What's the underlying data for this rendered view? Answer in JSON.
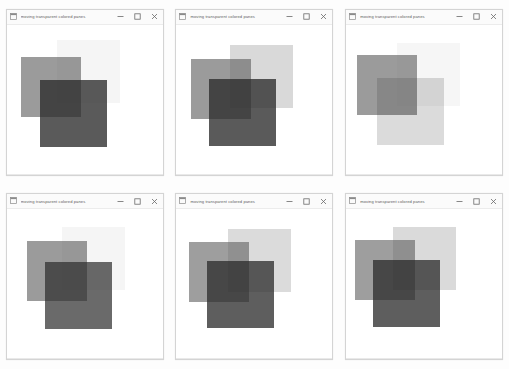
{
  "window": {
    "title": "moving transparent colored panes",
    "app_icon": "app-window-icon",
    "controls": {
      "minimize_label": "—",
      "maximize_label": "□",
      "close_label": "✕"
    }
  },
  "palette": {
    "background": "#ffffff",
    "frame_border": "#d4d4d4",
    "titlebar_bg": "#fbfbfb",
    "title_text": "#5c5c5c",
    "pane_dark": "#3f3f3f",
    "pane_mid": "#6f6f6f",
    "pane_light": "#d9d9d9",
    "pane_faint": "#f2f2f2",
    "overlap_black": "#0a0a0a"
  },
  "frames": [
    {
      "id": "frame-1",
      "title": "moving transparent colored panes",
      "panes": [
        {
          "name": "pane-light",
          "x": 50,
          "y": 15,
          "w": 63,
          "h": 63,
          "color": "#9b9b9b",
          "opacity": 0.1
        },
        {
          "name": "pane-mid",
          "x": 14,
          "y": 32,
          "w": 60,
          "h": 60,
          "color": "#5e5e5e",
          "opacity": 0.62
        },
        {
          "name": "pane-dark",
          "x": 33,
          "y": 55,
          "w": 67,
          "h": 67,
          "color": "#2b2b2b",
          "opacity": 0.78
        }
      ]
    },
    {
      "id": "frame-2",
      "title": "moving transparent colored panes",
      "panes": [
        {
          "name": "pane-light",
          "x": 54,
          "y": 20,
          "w": 63,
          "h": 63,
          "color": "#8f8f8f",
          "opacity": 0.34
        },
        {
          "name": "pane-mid",
          "x": 15,
          "y": 34,
          "w": 60,
          "h": 60,
          "color": "#5e5e5e",
          "opacity": 0.62
        },
        {
          "name": "pane-dark",
          "x": 33,
          "y": 54,
          "w": 67,
          "h": 67,
          "color": "#2b2b2b",
          "opacity": 0.78
        }
      ]
    },
    {
      "id": "frame-3",
      "title": "moving transparent colored panes",
      "panes": [
        {
          "name": "pane-light",
          "x": 51,
          "y": 18,
          "w": 63,
          "h": 63,
          "color": "#9b9b9b",
          "opacity": 0.09
        },
        {
          "name": "pane-mid",
          "x": 11,
          "y": 30,
          "w": 60,
          "h": 60,
          "color": "#5e5e5e",
          "opacity": 0.62
        },
        {
          "name": "pane-dark",
          "x": 31,
          "y": 53,
          "w": 67,
          "h": 67,
          "color": "#2b2b2b",
          "opacity": 0.17
        }
      ]
    },
    {
      "id": "frame-4",
      "title": "moving transparent colored panes",
      "panes": [
        {
          "name": "pane-light",
          "x": 55,
          "y": 18,
          "w": 63,
          "h": 63,
          "color": "#9b9b9b",
          "opacity": 0.1
        },
        {
          "name": "pane-mid",
          "x": 20,
          "y": 32,
          "w": 60,
          "h": 60,
          "color": "#5e5e5e",
          "opacity": 0.62
        },
        {
          "name": "pane-dark",
          "x": 38,
          "y": 53,
          "w": 67,
          "h": 67,
          "color": "#2b2b2b",
          "opacity": 0.7
        }
      ]
    },
    {
      "id": "frame-5",
      "title": "moving transparent colored panes",
      "panes": [
        {
          "name": "pane-light",
          "x": 52,
          "y": 20,
          "w": 63,
          "h": 63,
          "color": "#8f8f8f",
          "opacity": 0.32
        },
        {
          "name": "pane-mid",
          "x": 13,
          "y": 33,
          "w": 60,
          "h": 60,
          "color": "#5e5e5e",
          "opacity": 0.6
        },
        {
          "name": "pane-dark",
          "x": 31,
          "y": 52,
          "w": 67,
          "h": 67,
          "color": "#2b2b2b",
          "opacity": 0.76
        }
      ]
    },
    {
      "id": "frame-6",
      "title": "moving transparent colored panes",
      "panes": [
        {
          "name": "pane-light",
          "x": 47,
          "y": 18,
          "w": 63,
          "h": 63,
          "color": "#8f8f8f",
          "opacity": 0.33
        },
        {
          "name": "pane-mid",
          "x": 9,
          "y": 31,
          "w": 60,
          "h": 60,
          "color": "#5e5e5e",
          "opacity": 0.6
        },
        {
          "name": "pane-dark",
          "x": 27,
          "y": 51,
          "w": 67,
          "h": 67,
          "color": "#2b2b2b",
          "opacity": 0.76
        }
      ]
    }
  ]
}
